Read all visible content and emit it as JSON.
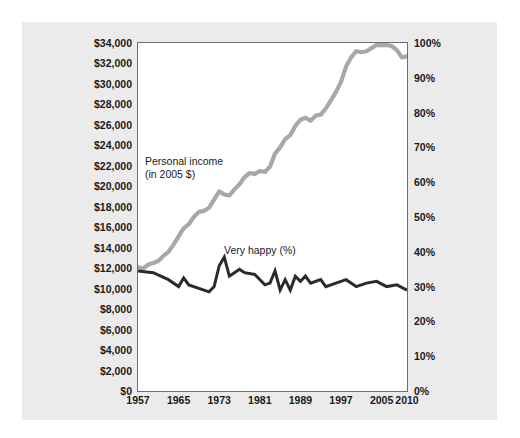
{
  "chart_data": {
    "type": "line",
    "title": "",
    "subtitle": "",
    "xlabel": "",
    "ylabel": "",
    "grid": false,
    "legend_position": "inline-annotations",
    "xlim": [
      1957,
      2010
    ],
    "x_ticks": [
      "1957",
      "1965",
      "1973",
      "1981",
      "1989",
      "1997",
      "2005",
      "2010"
    ],
    "x_tick_values": [
      1957,
      1965,
      1973,
      1981,
      1989,
      1997,
      2005,
      2010
    ],
    "axes": {
      "left": {
        "label": "Personal income (in 2005 $)",
        "ylim": [
          0,
          34000
        ],
        "tick_labels": [
          "$34,000",
          "$32,000",
          "$30,000",
          "$28,000",
          "$26,000",
          "$24,000",
          "$22,000",
          "$20,000",
          "$18,000",
          "$16,000",
          "$14,000",
          "$12,000",
          "$10,000",
          "$8,000",
          "$6,000",
          "$4,000",
          "$2,000",
          "$0"
        ],
        "tick_values": [
          34000,
          32000,
          30000,
          28000,
          26000,
          24000,
          22000,
          20000,
          18000,
          16000,
          14000,
          12000,
          10000,
          8000,
          6000,
          4000,
          2000,
          0
        ]
      },
      "right": {
        "label": "Very happy (%)",
        "ylim": [
          0,
          100
        ],
        "tick_labels": [
          "100%",
          "90%",
          "80%",
          "70%",
          "60%",
          "50%",
          "40%",
          "30%",
          "20%",
          "10%",
          "0%"
        ],
        "tick_values": [
          100,
          90,
          80,
          70,
          60,
          50,
          40,
          30,
          20,
          10,
          0
        ]
      }
    },
    "series": [
      {
        "name": "Personal income (in 2005 $)",
        "annotation": "Personal income\n(in 2005 $)",
        "axis": "left",
        "color": "#a8a8a8",
        "line_width": 4.2,
        "x": [
          1957,
          1958,
          1959,
          1960,
          1961,
          1962,
          1963,
          1964,
          1965,
          1966,
          1967,
          1968,
          1969,
          1970,
          1971,
          1972,
          1973,
          1974,
          1975,
          1976,
          1977,
          1978,
          1979,
          1980,
          1981,
          1982,
          1983,
          1984,
          1985,
          1986,
          1987,
          1988,
          1989,
          1990,
          1991,
          1992,
          1993,
          1994,
          1995,
          1996,
          1997,
          1998,
          1999,
          2000,
          2001,
          2002,
          2003,
          2004,
          2005,
          2006,
          2007,
          2008,
          2009,
          2010
        ],
        "values": [
          12100,
          11950,
          12350,
          12500,
          12700,
          13200,
          13600,
          14300,
          15100,
          15900,
          16300,
          17000,
          17500,
          17600,
          17900,
          18700,
          19500,
          19200,
          19100,
          19700,
          20200,
          20900,
          21300,
          21200,
          21500,
          21400,
          21900,
          23200,
          23800,
          24600,
          25000,
          25900,
          26500,
          26700,
          26400,
          26900,
          27000,
          27600,
          28400,
          29200,
          30200,
          31700,
          32600,
          33200,
          33100,
          33200,
          33500,
          33800,
          33800,
          33800,
          33700,
          33300,
          32600,
          32700
        ]
      },
      {
        "name": "Very happy (%)",
        "annotation": "Very happy (%)",
        "axis": "right",
        "color": "#2b2b2b",
        "line_width": 3.0,
        "x": [
          1957,
          1960,
          1963,
          1965,
          1966,
          1967,
          1971,
          1972,
          1973,
          1974,
          1975,
          1976,
          1977,
          1978,
          1980,
          1982,
          1983,
          1984,
          1985,
          1986,
          1987,
          1988,
          1989,
          1990,
          1991,
          1993,
          1994,
          1996,
          1998,
          2000,
          2002,
          2004,
          2006,
          2008,
          2010
        ],
        "values": [
          34.5,
          34.0,
          32.0,
          30.0,
          32.5,
          30.5,
          28.5,
          30.0,
          36.0,
          38.5,
          33.0,
          34.0,
          35.0,
          34.0,
          33.5,
          30.5,
          31.0,
          34.5,
          29.0,
          32.0,
          29.0,
          33.0,
          31.5,
          33.0,
          31.0,
          32.0,
          30.0,
          31.0,
          32.0,
          30.0,
          31.0,
          31.5,
          30.0,
          30.5,
          29.0
        ]
      }
    ]
  },
  "annotations": {
    "income_label_line1": "Personal income",
    "income_label_line2": "(in 2005 $)",
    "happy_label": "Very happy (%)"
  }
}
